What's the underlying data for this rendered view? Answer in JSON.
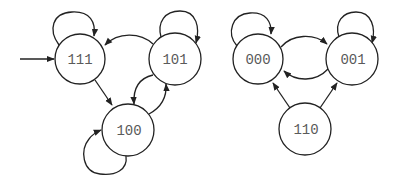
{
  "diagram": {
    "type": "state-machine",
    "start_state": "111",
    "colors": {
      "stroke": "#222222",
      "label": "#5a5a5a",
      "background": "#ffffff"
    },
    "nodes": [
      {
        "id": "111",
        "label": "111",
        "cx": 80,
        "cy": 59,
        "r": 25
      },
      {
        "id": "101",
        "label": "101",
        "cx": 175,
        "cy": 59,
        "r": 26
      },
      {
        "id": "100",
        "label": "100",
        "cx": 128,
        "cy": 130,
        "r": 26
      },
      {
        "id": "000",
        "label": "000",
        "cx": 258,
        "cy": 59,
        "r": 25
      },
      {
        "id": "001",
        "label": "001",
        "cx": 352,
        "cy": 59,
        "r": 26
      },
      {
        "id": "110",
        "label": "110",
        "cx": 305,
        "cy": 129,
        "r": 26
      }
    ],
    "edges": [
      {
        "from": "start",
        "to": "111",
        "kind": "initial"
      },
      {
        "from": "111",
        "to": "111",
        "kind": "self-loop"
      },
      {
        "from": "101",
        "to": "101",
        "kind": "self-loop"
      },
      {
        "from": "100",
        "to": "100",
        "kind": "self-loop"
      },
      {
        "from": "000",
        "to": "000",
        "kind": "self-loop"
      },
      {
        "from": "001",
        "to": "001",
        "kind": "self-loop"
      },
      {
        "from": "101",
        "to": "111",
        "kind": "curve"
      },
      {
        "from": "111",
        "to": "100",
        "kind": "straight"
      },
      {
        "from": "101",
        "to": "100",
        "kind": "curve"
      },
      {
        "from": "100",
        "to": "101",
        "kind": "curve"
      },
      {
        "from": "000",
        "to": "001",
        "kind": "curve"
      },
      {
        "from": "001",
        "to": "000",
        "kind": "curve"
      },
      {
        "from": "110",
        "to": "000",
        "kind": "straight"
      },
      {
        "from": "110",
        "to": "001",
        "kind": "straight"
      }
    ]
  }
}
